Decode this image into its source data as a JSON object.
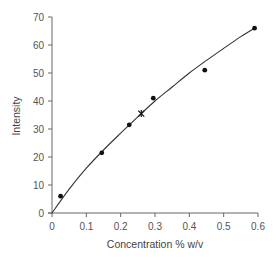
{
  "chart_data": {
    "type": "scatter",
    "title": "",
    "xlabel": "Concentration % w/v",
    "ylabel": "Intensity",
    "xlim": [
      0,
      0.6
    ],
    "ylim": [
      0,
      70
    ],
    "x_ticks": [
      0,
      0.1,
      0.2,
      0.3,
      0.4,
      0.5,
      0.6
    ],
    "x_tick_labels": [
      "0",
      "0.1",
      "0.2",
      "0.3",
      "0.4",
      "0.5",
      "0.6"
    ],
    "y_ticks": [
      0,
      10,
      20,
      30,
      40,
      50,
      60,
      70
    ],
    "y_tick_labels": [
      "0",
      "10",
      "20",
      "30",
      "40",
      "50",
      "60",
      "70"
    ],
    "grid": false,
    "legend": null,
    "series": [
      {
        "name": "measured",
        "marker": "dot",
        "points": [
          {
            "x": 0.025,
            "y": 6
          },
          {
            "x": 0.145,
            "y": 21.5
          },
          {
            "x": 0.225,
            "y": 31.5
          },
          {
            "x": 0.295,
            "y": 41
          },
          {
            "x": 0.445,
            "y": 51
          },
          {
            "x": 0.59,
            "y": 66
          }
        ]
      },
      {
        "name": "unknown",
        "marker": "star",
        "points": [
          {
            "x": 0.26,
            "y": 35.5
          }
        ]
      },
      {
        "name": "calibration curve",
        "marker": "line",
        "points": [
          {
            "x": 0,
            "y": 0
          },
          {
            "x": 0.05,
            "y": 8.5
          },
          {
            "x": 0.1,
            "y": 16
          },
          {
            "x": 0.15,
            "y": 22.5
          },
          {
            "x": 0.2,
            "y": 28.5
          },
          {
            "x": 0.26,
            "y": 35.5
          },
          {
            "x": 0.3,
            "y": 40
          },
          {
            "x": 0.35,
            "y": 45
          },
          {
            "x": 0.4,
            "y": 50
          },
          {
            "x": 0.45,
            "y": 54.5
          },
          {
            "x": 0.5,
            "y": 58.8
          },
          {
            "x": 0.55,
            "y": 63
          },
          {
            "x": 0.59,
            "y": 66
          }
        ]
      }
    ]
  }
}
